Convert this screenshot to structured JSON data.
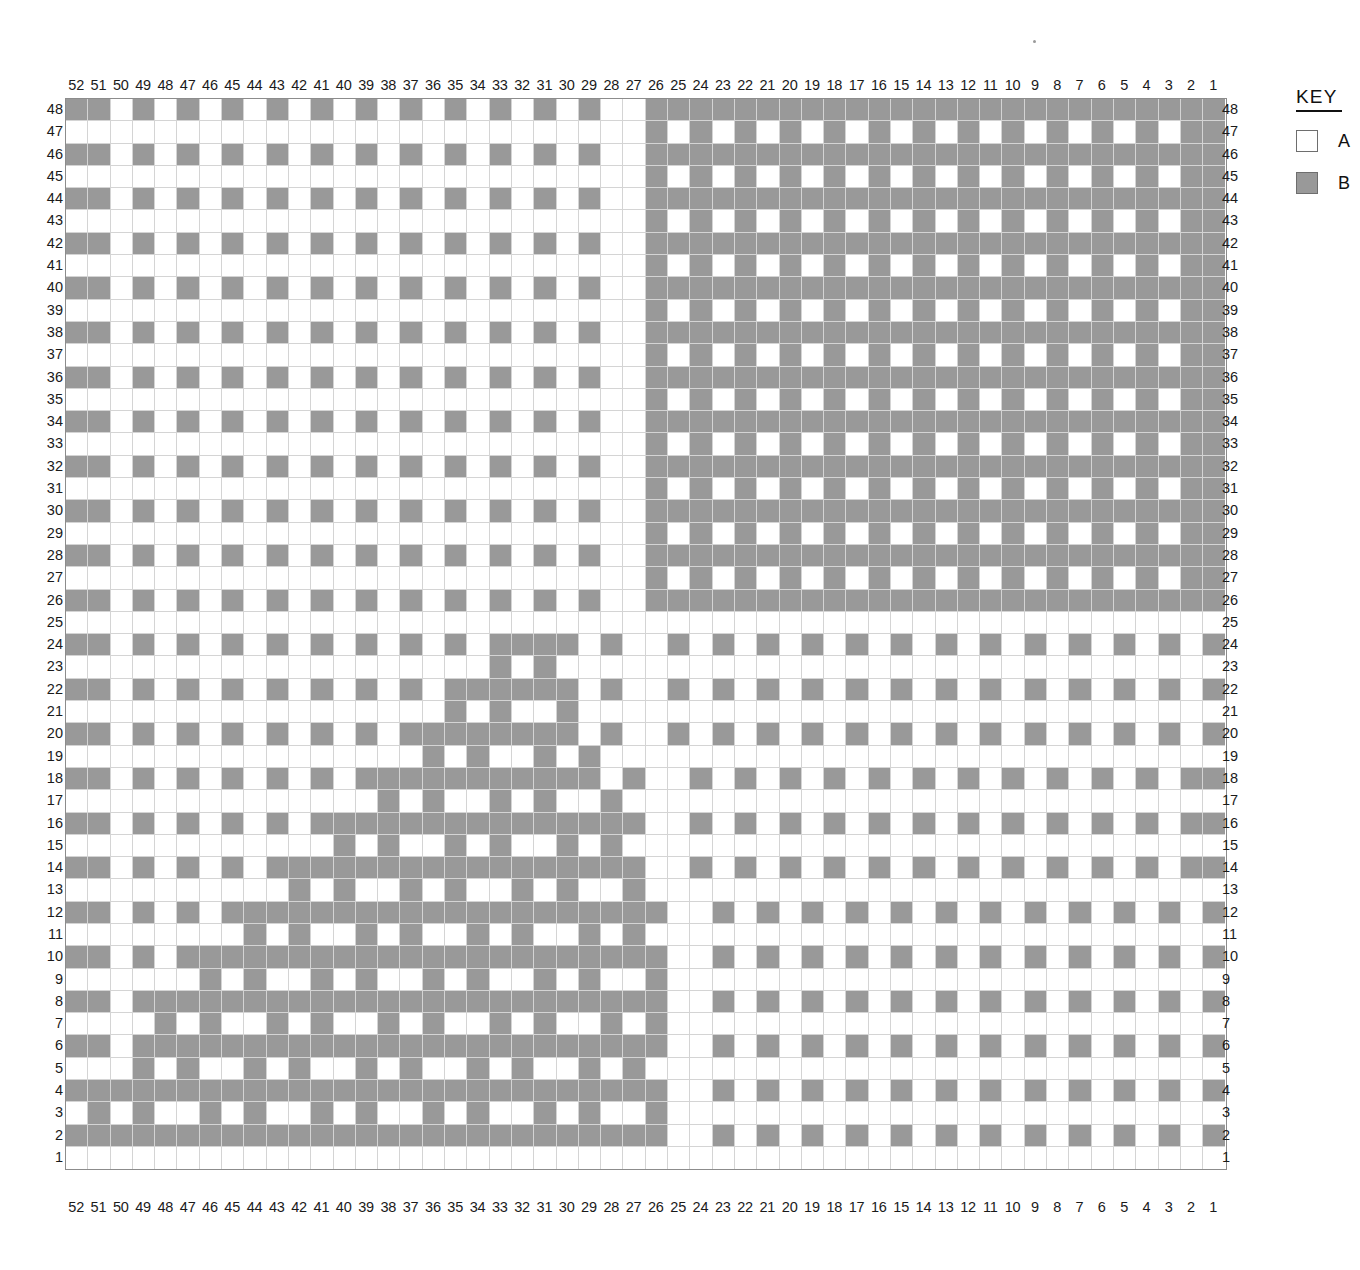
{
  "key": {
    "title": "KEY",
    "entries": [
      {
        "symbol": "A",
        "label": "A",
        "color": "#ffffff"
      },
      {
        "symbol": "B",
        "label": "B",
        "color": "#999999"
      }
    ]
  },
  "chart_data": {
    "type": "heatmap",
    "title": "",
    "subtitle": "",
    "xlabel": "",
    "ylabel": "",
    "grid": true,
    "legend_position": "right",
    "colors": {
      "A": "#ffffff",
      "B": "#999999",
      "grid_line": "#d4d4d4",
      "border": "#8c8c8c"
    },
    "n_columns": 52,
    "n_rows": 48,
    "column_labels_top": [
      52,
      51,
      50,
      49,
      48,
      47,
      46,
      45,
      44,
      43,
      42,
      41,
      40,
      39,
      38,
      37,
      36,
      35,
      34,
      33,
      32,
      31,
      30,
      29,
      28,
      27,
      26,
      25,
      24,
      23,
      22,
      21,
      20,
      19,
      18,
      17,
      16,
      15,
      14,
      13,
      12,
      11,
      10,
      9,
      8,
      7,
      6,
      5,
      4,
      3,
      2,
      1
    ],
    "column_labels_bottom": [
      52,
      51,
      50,
      49,
      48,
      47,
      46,
      45,
      44,
      43,
      42,
      41,
      40,
      39,
      38,
      37,
      36,
      35,
      34,
      33,
      32,
      31,
      30,
      29,
      28,
      27,
      26,
      25,
      24,
      23,
      22,
      21,
      20,
      19,
      18,
      17,
      16,
      15,
      14,
      13,
      12,
      11,
      10,
      9,
      8,
      7,
      6,
      5,
      4,
      3,
      2,
      1
    ],
    "row_labels_left": [
      48,
      47,
      46,
      45,
      44,
      43,
      42,
      41,
      40,
      39,
      38,
      37,
      36,
      35,
      34,
      33,
      32,
      31,
      30,
      29,
      28,
      27,
      26,
      25,
      24,
      23,
      22,
      21,
      20,
      19,
      18,
      17,
      16,
      15,
      14,
      13,
      12,
      11,
      10,
      9,
      8,
      7,
      6,
      5,
      4,
      3,
      2,
      1
    ],
    "row_labels_right": [
      48,
      47,
      46,
      45,
      44,
      43,
      42,
      41,
      40,
      39,
      38,
      37,
      36,
      35,
      34,
      33,
      32,
      31,
      30,
      29,
      28,
      27,
      26,
      25,
      24,
      23,
      22,
      21,
      20,
      19,
      18,
      17,
      16,
      15,
      14,
      13,
      12,
      11,
      10,
      9,
      8,
      7,
      6,
      5,
      4,
      3,
      2,
      1
    ],
    "cell_values_note": "Rows listed top (48) to bottom (1); within each row, columns left (52) to right (1). A=background, B=filled.",
    "rows": [
      {
        "row": 48,
        "cells": "BBABABABABABABABABABABABAABBBBBBBBBBBBBBBBBBBBBBBBBB"
      },
      {
        "row": 47,
        "cells": "AAAAAAAAAAAAAAAAAAAAAAAAAABABABABABABABABABABABABABB"
      },
      {
        "row": 46,
        "cells": "BBABABABABABABABABABABABAABBBBBBBBBBBBBBBBBBBBBBBBBB"
      },
      {
        "row": 45,
        "cells": "AAAAAAAAAAAAAAAAAAAAAAAAAABABABABABABABABABABABABABB"
      },
      {
        "row": 44,
        "cells": "BBABABABABABABABABABABABAABBBBBBBBBBBBBBBBBBBBBBBBBB"
      },
      {
        "row": 43,
        "cells": "AAAAAAAAAAAAAAAAAAAAAAAAAABABABABABABABABABABABABABB"
      },
      {
        "row": 42,
        "cells": "BBABABABABABABABABABABABAABBBBBBBBBBBBBBBBBBBBBBBBBB"
      },
      {
        "row": 41,
        "cells": "AAAAAAAAAAAAAAAAAAAAAAAAAABABABABABABABABABABABABABB"
      },
      {
        "row": 40,
        "cells": "BBABABABABABABABABABABABAABBBBBBBBBBBBBBBBBBBBBBBBBB"
      },
      {
        "row": 39,
        "cells": "AAAAAAAAAAAAAAAAAAAAAAAAAABABABABABABABABABABABABABB"
      },
      {
        "row": 38,
        "cells": "BBABABABABABABABABABABABAABBBBBBBBBBBBBBBBBBBBBBBBBB"
      },
      {
        "row": 37,
        "cells": "AAAAAAAAAAAAAAAAAAAAAAAAAABABABABABABABABABABABABABB"
      },
      {
        "row": 36,
        "cells": "BBABABABABABABABABABABABAABBBBBBBBBBBBBBBBBBBBBBBBBB"
      },
      {
        "row": 35,
        "cells": "AAAAAAAAAAAAAAAAAAAAAAAAAABABABABABABABABABABABABABB"
      },
      {
        "row": 34,
        "cells": "BBABABABABABABABABABABABAABBBBBBBBBBBBBBBBBBBBBBBBBB"
      },
      {
        "row": 33,
        "cells": "AAAAAAAAAAAAAAAAAAAAAAAAAABABABABABABABABABABABABABB"
      },
      {
        "row": 32,
        "cells": "BBABABABABABABABABABABABAABBBBBBBBBBBBBBBBBBBBBBBBBB"
      },
      {
        "row": 31,
        "cells": "AAAAAAAAAAAAAAAAAAAAAAAAAABABABABABABABABABABABABABB"
      },
      {
        "row": 30,
        "cells": "BBABABABABABABABABABABABAABBBBBBBBBBBBBBBBBBBBBBBBBB"
      },
      {
        "row": 29,
        "cells": "AAAAAAAAAAAAAAAAAAAAAAAAAABABABABABABABABABABABABABB"
      },
      {
        "row": 28,
        "cells": "BBABABABABABABABABABABABAABBBBBBBBBBBBBBBBBBBBBBBBBB"
      },
      {
        "row": 27,
        "cells": "AAAAAAAAAAAAAAAAAAAAAAAAAABABABABABABABABABABABABABB"
      },
      {
        "row": 26,
        "cells": "BBABABABABABABABABABABABAABBBBBBBBBBBBBBBBBBBBBBBBBB"
      },
      {
        "row": 25,
        "cells": "AAAAAAAAAAAAAAAAAAAAAAAAAAAAAAAAAAAAAAAAAAAAAAAAAAAA"
      },
      {
        "row": 24,
        "cells": "BBABABABABABABABABABBBBABAABABABABABABABABABABABABABB"
      },
      {
        "row": 23,
        "cells": "AAAAAAAAAAAAAAAAAAABABAAAAAAAAAAAAAAAAAAAAAAAAAAAAAA"
      },
      {
        "row": 22,
        "cells": "BBABABABABABABABABBBBBBABAABABABABABABABABABABABABABB"
      },
      {
        "row": 21,
        "cells": "AAAAAAAAAAAAAAAAABABAABAAAAAAAAAAAAAAAAAAAAAAAAAAAAA"
      },
      {
        "row": 20,
        "cells": "BBABABABABABABABBBBBBBBABAABABABABABABABABABABABABABB"
      },
      {
        "row": 19,
        "cells": "AAAAAAAAAAAAAAAABABAABABAAAAAAAAAAAAAAAAAAAAAAAAAAAA"
      },
      {
        "row": 18,
        "cells": "BBABABABABABABBBBBBBBBBBABAABABABABABABABABABABABABB"
      },
      {
        "row": 17,
        "cells": "AAAAAAAAAAAAAABABAABABAABAAAAAAAAAAAAAAAAAAAAAAAAAAA"
      },
      {
        "row": 16,
        "cells": "BBABABABABABBBBBBBBBBBBBBBAABABABABABABABABABABABABB"
      },
      {
        "row": 15,
        "cells": "AAAAAAAAAAAABABAABABAABABAAAAAAAAAAAAAAAAAAAAAAAAAAA"
      },
      {
        "row": 14,
        "cells": "BBABABABABBBBBBBBBBBBBBBBBAABABABABABABABABABABABABB"
      },
      {
        "row": 13,
        "cells": "AAAAAAAAAABABAABABAABABAABAAAAAAAAAAAAAAAAAAAAAAAAAA"
      },
      {
        "row": 12,
        "cells": "BBABABABBBBBBBBBBBBBBBBBBBBAABABABABABABABABABABABAB"
      },
      {
        "row": 11,
        "cells": "AAAAAAAABABAABABAABABAABABAAAAAAAAAAAAAAAAAAAAAAAAAA"
      },
      {
        "row": 10,
        "cells": "BBABABBBBBBBBBBBBBBBBBBBBBBAABABABABABABABABABABABAB"
      },
      {
        "row": 9,
        "cells": "AAAAAABABAABABAABABAABABAABAAAAAAAAAAAAAAAAAAAAAAAAA"
      },
      {
        "row": 8,
        "cells": "BBABBBBBBBBBBBBBBBBBBBBBBBBAABABABABABABABABABABABAB"
      },
      {
        "row": 7,
        "cells": "AAAABABAABABAABABAABABAABABAAAAAAAAAAAAAAAAAAAAAAAAA"
      },
      {
        "row": 6,
        "cells": "BBABBBBBBBBBBBBBBBBBBBBBBBBAABABABABABABABABABABABAB"
      },
      {
        "row": 5,
        "cells": "AAABABAABABAABABAABABAABABAAAAAAAAAAAAAAAAAAAAAAAAAA"
      },
      {
        "row": 4,
        "cells": "BBBBBBBBBBBBBBBBBBBBBBBBBBBAABABABABABABABABABABABAB"
      },
      {
        "row": 3,
        "cells": "ABABAABABAABABAABABAABABAABAAAAAAAAAAAAAAAAAAAAAAAAA"
      },
      {
        "row": 2,
        "cells": "BBBBBBBBBBBBBBBBBBBBBBBBBBBAABABABABABABABABABABABAB"
      },
      {
        "row": 1,
        "cells": "AAAAAAAAAAAAAAAAAAAAAAAAAAAAAAAAAAAAAAAAAAAAAAAAAAAA"
      }
    ]
  }
}
